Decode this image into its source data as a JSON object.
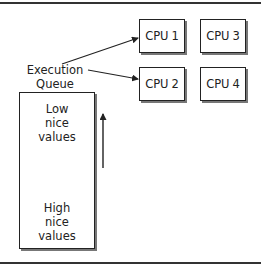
{
  "diagram": {
    "queue_label": {
      "line1": "Execution",
      "line2": "Queue"
    },
    "queue_box": {
      "top_text": {
        "line1": "Low",
        "line2": "nice",
        "line3": "values"
      },
      "bottom_text": {
        "line1": "High",
        "line2": "nice",
        "line3": "values"
      }
    },
    "cpus": [
      {
        "label": "CPU 1"
      },
      {
        "label": "CPU 2"
      },
      {
        "label": "CPU 3"
      },
      {
        "label": "CPU 4"
      }
    ],
    "edges": [
      {
        "from": "Execution Queue",
        "to": "CPU 1"
      },
      {
        "from": "Execution Queue",
        "to": "CPU 2"
      }
    ],
    "priority_arrow": {
      "direction": "up",
      "meaning": "from high nice values to low nice values"
    },
    "colors": {
      "stroke": "#222222",
      "shadow": "#777777",
      "background": "#ffffff"
    }
  }
}
